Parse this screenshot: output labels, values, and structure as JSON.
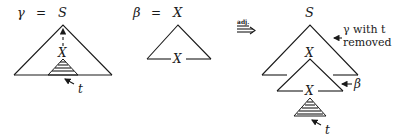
{
  "figure": {
    "gamma_tree": {
      "name_symbol": "γ",
      "equals": "=",
      "root_label": "S",
      "internal_node_label": "X",
      "subtree_label": "t"
    },
    "beta_tree": {
      "name_symbol": "β",
      "equals": "=",
      "root_label": "X",
      "foot_label": "X"
    },
    "operation": {
      "label": "adj.",
      "arrow": "⟹"
    },
    "result_tree": {
      "root_label": "S",
      "beta_root_label": "X",
      "beta_foot_label": "X",
      "subtree_label": "t",
      "annotation_gamma_line1": "γ with t",
      "annotation_gamma_line2": "removed",
      "annotation_beta": "β"
    }
  }
}
